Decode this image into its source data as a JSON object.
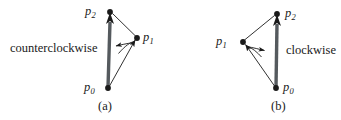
{
  "figure": {
    "background": "#ffffff",
    "ink": "#1a1a1a",
    "width": 341,
    "height": 120
  },
  "panels": [
    {
      "id": "a",
      "caption": "(a)",
      "orientation_label": "counterclockwise",
      "vertices": [
        {
          "name": "p0",
          "base": "p",
          "sub": "0",
          "x": 108,
          "y": 88,
          "label_x": 84,
          "label_y": 81
        },
        {
          "name": "p1",
          "base": "p",
          "sub": "1",
          "x": 137,
          "y": 38,
          "label_x": 143,
          "label_y": 31
        },
        {
          "name": "p2",
          "base": "p",
          "sub": "2",
          "x": 110,
          "y": 12,
          "label_x": 85,
          "label_y": 5
        }
      ],
      "orientation_text_x": 10,
      "orientation_text_y": 42,
      "caption_x": 98,
      "caption_y": 100
    },
    {
      "id": "b",
      "caption": "(b)",
      "orientation_label": "clockwise",
      "vertices": [
        {
          "name": "p0",
          "base": "p",
          "sub": "0",
          "x": 276,
          "y": 88,
          "label_x": 283,
          "label_y": 81
        },
        {
          "name": "p1",
          "base": "p",
          "sub": "1",
          "x": 243,
          "y": 42,
          "label_x": 216,
          "label_y": 35
        },
        {
          "name": "p2",
          "base": "p",
          "sub": "2",
          "x": 277,
          "y": 14,
          "label_x": 285,
          "label_y": 7
        }
      ],
      "orientation_text_x": 286,
      "orientation_text_y": 44,
      "caption_x": 271,
      "caption_y": 100
    }
  ],
  "icons": {
    "vertex_dot": "filled-dot",
    "main_arrow": "thick-up-arrow",
    "turn_arc": "curved-turn-arrow"
  }
}
